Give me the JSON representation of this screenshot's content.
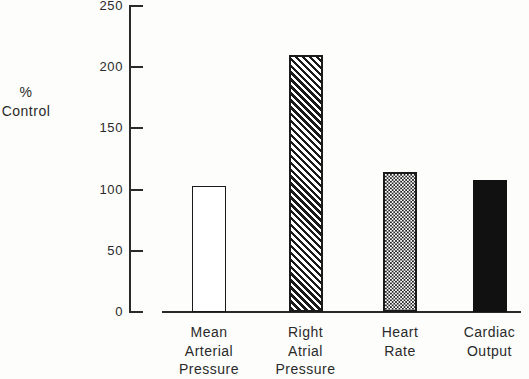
{
  "chart_data": {
    "type": "bar",
    "title": "",
    "xlabel": "",
    "ylabel": "% Control",
    "categories": [
      "Mean Arterial Pressure",
      "Right Atrial Pressure",
      "Heart Rate",
      "Cardiac Output"
    ],
    "category_label_lines": [
      [
        "Mean",
        "Arterial",
        "Pressure"
      ],
      [
        "Right",
        "Atrial",
        "Pressure"
      ],
      [
        "Heart",
        "Rate"
      ],
      [
        "Cardiac",
        "Output"
      ]
    ],
    "values": [
      103,
      210,
      114,
      108
    ],
    "bar_patterns": [
      "outline-white",
      "diagonal-hatch",
      "cross-hatch",
      "solid-black"
    ],
    "ylim": [
      0,
      250
    ],
    "yticks": [
      0,
      50,
      100,
      150,
      200,
      250
    ],
    "grid": false,
    "legend": "none"
  },
  "axis": {
    "ylabel_line1": "%",
    "ylabel_line2": "Control"
  },
  "colors": {
    "ink": "#2a2a2a",
    "solid_bar": "#111111",
    "background": "#fdfdfc"
  }
}
